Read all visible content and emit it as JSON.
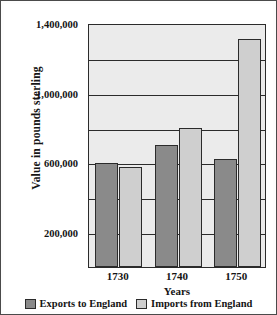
{
  "chart_data": {
    "type": "bar",
    "title": "",
    "xlabel": "Years",
    "ylabel": "Value in pounds sterling",
    "categories": [
      "1730",
      "1740",
      "1750"
    ],
    "series": [
      {
        "name": "Exports to England",
        "color": "#8a8a8a",
        "values": [
          595000,
          700000,
          620000
        ]
      },
      {
        "name": "Imports from England",
        "color": "#cfcfcf",
        "values": [
          575000,
          800000,
          1310000
        ]
      }
    ],
    "ylim": [
      0,
      1400000
    ],
    "ytick_values": [
      200000,
      600000,
      1000000,
      1400000
    ],
    "ytick_labels": [
      "200,000",
      "600,000",
      "1,000,000",
      "1,400,000"
    ],
    "gridline_values": [
      200000,
      400000,
      600000,
      800000,
      1000000,
      1200000,
      1400000
    ],
    "grid": true,
    "legend_position": "bottom",
    "plot_background": "#ebebeb",
    "axis_color": "#2b2b2b"
  },
  "axes": {
    "y_title": "Value in pounds sterling",
    "x_title": "Years",
    "y_ticks": [
      {
        "label": "1,400,000",
        "value": 1400000
      },
      {
        "label": "1,000,000",
        "value": 1000000
      },
      {
        "label": "600,000",
        "value": 600000
      },
      {
        "label": "200,000",
        "value": 200000
      }
    ],
    "x_ticks": [
      {
        "label": "1730"
      },
      {
        "label": "1740"
      },
      {
        "label": "1750"
      }
    ]
  },
  "legend": {
    "items": [
      {
        "label": "Exports to England",
        "color": "#8a8a8a"
      },
      {
        "label": "Imports from England",
        "color": "#cfcfcf"
      }
    ]
  }
}
